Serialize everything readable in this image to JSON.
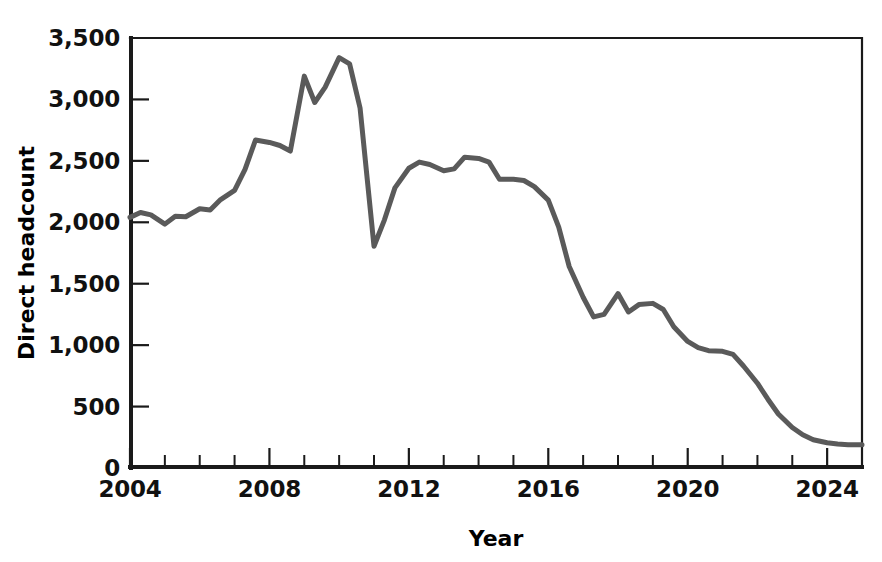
{
  "chart_data": {
    "type": "line",
    "title": "",
    "xlabel": "Year",
    "ylabel": "Direct headcount",
    "xlim": [
      2004,
      2025
    ],
    "ylim": [
      0,
      3500
    ],
    "grid": false,
    "legend": "none",
    "line_color": "#5a5a5a",
    "axis_color": "#1a1a1a",
    "y_ticks": [
      {
        "value": 3500,
        "label": "3,500"
      },
      {
        "value": 3000,
        "label": "3,000"
      },
      {
        "value": 2500,
        "label": "2,500"
      },
      {
        "value": 2000,
        "label": "2,000"
      },
      {
        "value": 1500,
        "label": "1,500"
      },
      {
        "value": 1000,
        "label": "1,000"
      },
      {
        "value": 500,
        "label": "500"
      },
      {
        "value": 0,
        "label": "0"
      }
    ],
    "x_ticks_major": [
      {
        "value": 2004,
        "label": "2004"
      },
      {
        "value": 2008,
        "label": "2008"
      },
      {
        "value": 2012,
        "label": "2012"
      },
      {
        "value": 2016,
        "label": "2016"
      },
      {
        "value": 2020,
        "label": "2020"
      },
      {
        "value": 2024,
        "label": "2024"
      }
    ],
    "x_ticks_minor": [
      2005,
      2006,
      2007,
      2009,
      2010,
      2011,
      2013,
      2014,
      2015,
      2017,
      2018,
      2019,
      2021,
      2022,
      2023,
      2025
    ],
    "series": [
      {
        "name": "Direct headcount",
        "x": [
          2004.0,
          2004.3,
          2004.6,
          2005.0,
          2005.3,
          2005.6,
          2006.0,
          2006.3,
          2006.6,
          2007.0,
          2007.3,
          2007.6,
          2008.0,
          2008.3,
          2008.6,
          2009.0,
          2009.3,
          2009.6,
          2010.0,
          2010.3,
          2010.6,
          2011.0,
          2011.3,
          2011.6,
          2012.0,
          2012.3,
          2012.6,
          2013.0,
          2013.3,
          2013.6,
          2014.0,
          2014.3,
          2014.6,
          2015.0,
          2015.3,
          2015.6,
          2016.0,
          2016.3,
          2016.6,
          2017.0,
          2017.3,
          2017.6,
          2018.0,
          2018.3,
          2018.6,
          2019.0,
          2019.3,
          2019.6,
          2020.0,
          2020.3,
          2020.6,
          2021.0,
          2021.3,
          2021.6,
          2022.0,
          2022.3,
          2022.6,
          2023.0,
          2023.3,
          2023.6,
          2024.0,
          2024.3,
          2024.6,
          2025.0
        ],
        "y": [
          2040,
          2080,
          2060,
          1985,
          2050,
          2045,
          2110,
          2100,
          2185,
          2260,
          2430,
          2670,
          2650,
          2625,
          2580,
          3190,
          2975,
          3100,
          3340,
          3290,
          2930,
          1805,
          2020,
          2280,
          2440,
          2490,
          2470,
          2420,
          2435,
          2530,
          2520,
          2490,
          2350,
          2350,
          2340,
          2290,
          2180,
          1960,
          1640,
          1390,
          1230,
          1250,
          1420,
          1270,
          1330,
          1340,
          1290,
          1150,
          1030,
          980,
          955,
          950,
          925,
          830,
          690,
          560,
          440,
          330,
          270,
          230,
          205,
          195,
          190,
          190
        ]
      }
    ]
  },
  "layout": {
    "plot_left": 130,
    "plot_right": 862,
    "plot_top": 38,
    "plot_bottom": 468
  }
}
